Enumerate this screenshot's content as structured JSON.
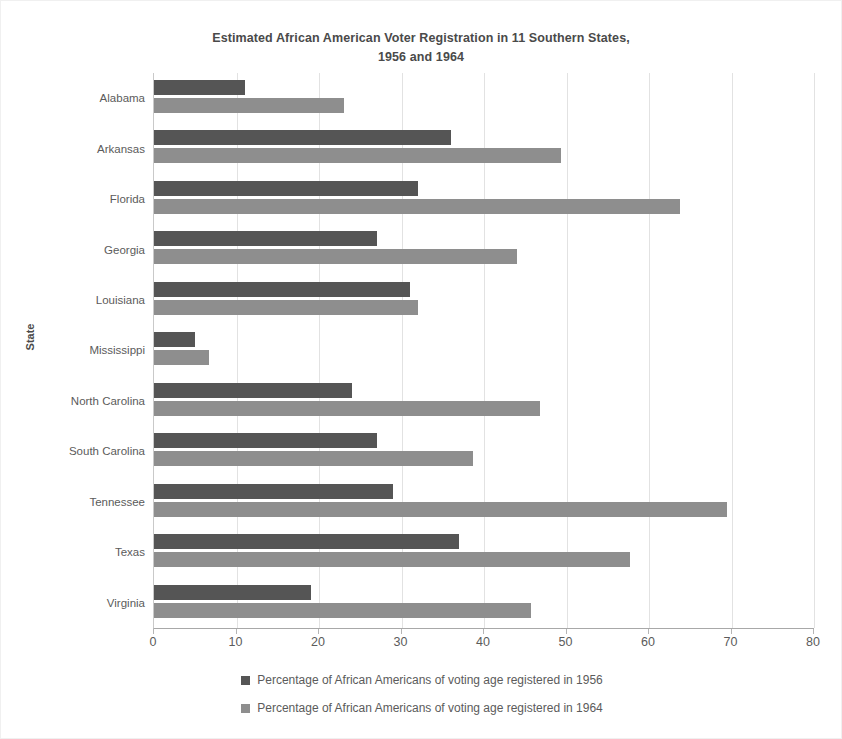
{
  "chart_data": {
    "type": "bar",
    "orientation": "horizontal",
    "title": "Estimated African American Voter Registration in 11 Southern States, 1956 and 1964",
    "title_lines": [
      "Estimated African American Voter Registration in 11 Southern States,",
      "1956 and 1964"
    ],
    "xlabel": "",
    "ylabel": "State",
    "xlim": [
      0,
      80
    ],
    "xticks": [
      0,
      10,
      20,
      30,
      40,
      50,
      60,
      70,
      80
    ],
    "xtick_labels": [
      "0",
      "10",
      "20",
      "30",
      "40",
      "50",
      "60",
      "70",
      "80"
    ],
    "grid": "vertical",
    "legend_position": "bottom",
    "categories": [
      "Alabama",
      "Arkansas",
      "Florida",
      "Georgia",
      "Louisiana",
      "Mississippi",
      "North Carolina",
      "South Carolina",
      "Tennessee",
      "Texas",
      "Virginia"
    ],
    "series": [
      {
        "name": "Percentage of African Americans of voting age registered in 1956",
        "color": "#555555",
        "values": [
          11.0,
          36.0,
          32.0,
          27.0,
          31.0,
          5.0,
          24.0,
          27.0,
          29.0,
          37.0,
          19.0
        ]
      },
      {
        "name": "Percentage of African Americans of voting age registered in 1964",
        "color": "#8e8e8e",
        "values": [
          23.0,
          49.3,
          63.8,
          44.0,
          32.0,
          6.7,
          46.8,
          38.7,
          69.5,
          57.7,
          45.7
        ]
      }
    ]
  },
  "colors": {
    "series_1956": "#555555",
    "series_1964": "#8e8e8e",
    "gridline": "#e2e2e2",
    "axis": "#a8a8a8",
    "text": "#5b5b5b",
    "title_text": "#4a4a4a"
  }
}
